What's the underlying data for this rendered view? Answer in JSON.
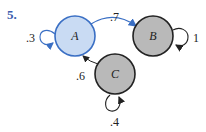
{
  "problem_number": "5.",
  "colors": {
    "accent": "#3b5cae",
    "node_a_fill": "#c9dbf3",
    "node_a_stroke": "#3a6fc4",
    "node_gray_fill": "#b9b9b9",
    "node_gray_stroke": "#222222",
    "edge_blue": "#3a6fc4",
    "edge_dark": "#222222"
  },
  "nodes": [
    {
      "id": "A",
      "label": "A"
    },
    {
      "id": "B",
      "label": "B"
    },
    {
      "id": "C",
      "label": "C"
    }
  ],
  "edges": [
    {
      "from": "A",
      "to": "A",
      "label": ".3"
    },
    {
      "from": "A",
      "to": "B",
      "label": ".7"
    },
    {
      "from": "B",
      "to": "B",
      "label": "1"
    },
    {
      "from": "C",
      "to": "A",
      "label": ".6"
    },
    {
      "from": "C",
      "to": "C",
      "label": ".4"
    }
  ]
}
